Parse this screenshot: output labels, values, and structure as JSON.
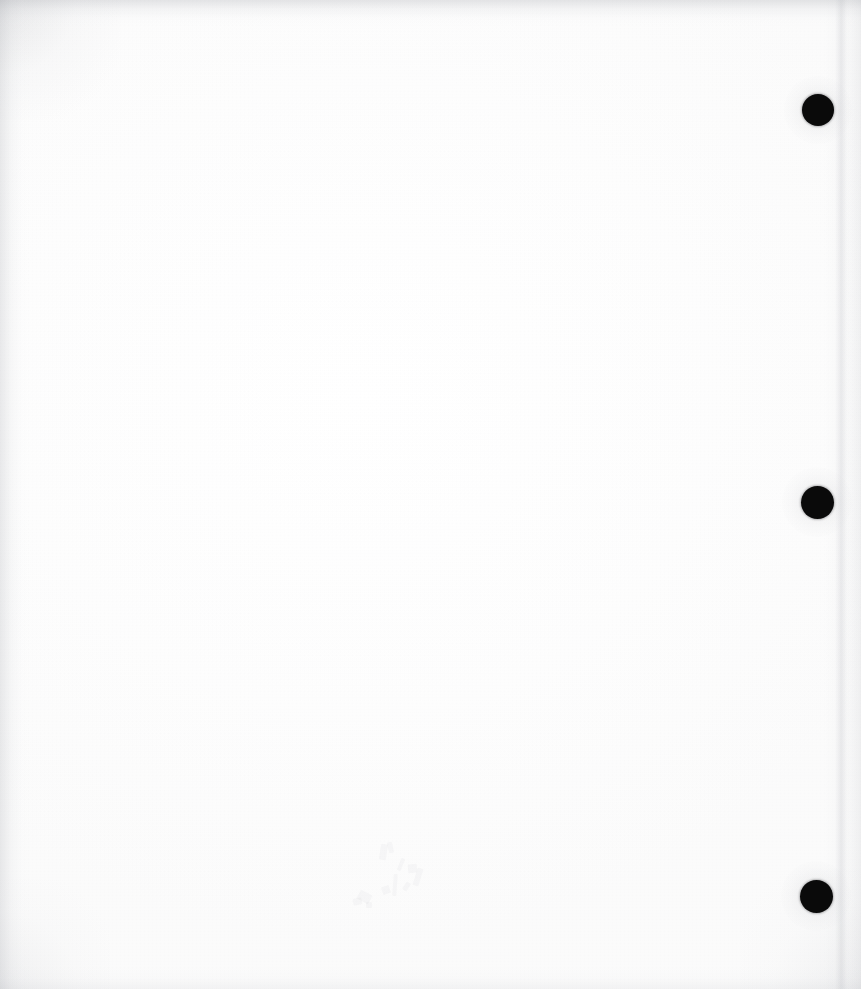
{
  "document": {
    "kind": "scanned-page",
    "state": "blank",
    "page_width": 861,
    "page_height": 989,
    "paper_color": "#fefefe",
    "background_color": "#ffffff",
    "visible_text": "",
    "notes_label": "blank scanned sheet"
  },
  "punch_holes": {
    "label": "three-hole punch",
    "count": 3,
    "color": "#0a0a0a",
    "diameter": 32,
    "items": [
      {
        "name": "punch-hole-top",
        "cx": 818,
        "cy": 110,
        "d": 32
      },
      {
        "name": "punch-hole-middle",
        "cx": 817,
        "cy": 502,
        "d": 33
      },
      {
        "name": "punch-hole-bottom",
        "cx": 816,
        "cy": 896,
        "d": 33
      }
    ]
  },
  "scan_artifacts": {
    "edge_shadow_color": "#a8aab0",
    "crease": {
      "name": "vertical-fold-crease",
      "x": 841,
      "orientation": "vertical"
    },
    "ghost_marks": {
      "name": "bleed-through-ghost-marks",
      "region_x": 352,
      "region_y": 842,
      "region_width": 86,
      "region_height": 72,
      "opacity": "very-faint"
    }
  }
}
